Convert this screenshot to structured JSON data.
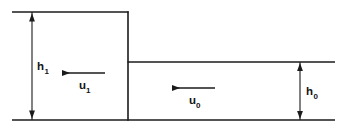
{
  "figure": {
    "background_color": "#ffffff",
    "line_color": "#1b1b1b",
    "text_color": "#141414"
  },
  "labels": {
    "depth_upstream": {
      "base": "h",
      "subscript": "1",
      "full": "h1",
      "meaning": "upstream flow depth"
    },
    "depth_downstream": {
      "base": "h",
      "subscript": "0",
      "full": "h0",
      "meaning": "downstream flow depth"
    },
    "velocity_upstream": {
      "base": "u",
      "subscript": "1",
      "full": "u1",
      "meaning": "upstream flow velocity"
    },
    "velocity_downstream": {
      "base": "u",
      "subscript": "0",
      "full": "u0",
      "meaning": "downstream flow velocity"
    }
  },
  "geometry": {
    "channel_bottom_y": 120,
    "upper_surface_y": 12,
    "lower_surface_y": 62,
    "step_x": 128,
    "left_edge_x": 12,
    "right_edge_x": 335,
    "h1_dimension_x": 32,
    "h0_dimension_x": 300,
    "u1_arrow": {
      "x_start": 105,
      "x_end": 60,
      "y": 73,
      "direction": "left"
    },
    "u0_arrow": {
      "x_start": 215,
      "x_end": 170,
      "y": 88,
      "direction": "left"
    }
  },
  "icons": {
    "arrow_head": "arrowhead-triangle"
  }
}
